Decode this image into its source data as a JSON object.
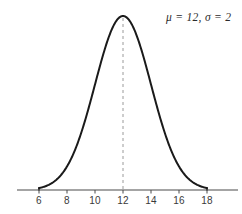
{
  "figure": {
    "width": 242,
    "height": 214,
    "background_color": "#ffffff"
  },
  "annotation": {
    "text": "μ = 12,  σ = 2",
    "mu_symbol": "μ",
    "sigma_symbol": "σ",
    "mu_value": "12",
    "sigma_value": "2",
    "color": "#2b2b2b"
  },
  "axis": {
    "line_color": "#4a4a4a",
    "tick_color": "#4a4a4a",
    "label_color": "#3a3a3a",
    "y_pixel": 190,
    "x_start_pixel": 17,
    "x_end_pixel": 238
  },
  "curve": {
    "color": "#1a1a1a",
    "stroke_width": 2,
    "mean": 12,
    "sigma": 2,
    "domain_min": 6,
    "domain_max": 18
  },
  "mean_line": {
    "color": "#9a9a9a",
    "dash": "3 3",
    "x_value": 12
  },
  "chart_data": {
    "type": "line",
    "title": "",
    "subtitle": "",
    "xlabel": "",
    "ylabel": "",
    "annotations": [
      "μ = 12, σ = 2"
    ],
    "legend_position": "top-right",
    "grid": false,
    "xlim": [
      5.2,
      19.5
    ],
    "ylim": [
      0,
      0.2
    ],
    "xticks": [
      6,
      8,
      10,
      12,
      14,
      16,
      18
    ],
    "xtick_labels": [
      "6",
      "8",
      "10",
      "12",
      "14",
      "16",
      "18"
    ],
    "yticks": [],
    "ytick_labels": [],
    "distribution": "normal",
    "parameters": {
      "mu": 12,
      "sigma": 2
    },
    "series": [
      {
        "name": "Normal PDF (μ=12, σ=2)",
        "color": "#1a1a1a",
        "x": [
          6,
          6.5,
          7,
          7.5,
          8,
          8.5,
          9,
          9.5,
          10,
          10.5,
          11,
          11.5,
          12,
          12.5,
          13,
          13.5,
          14,
          14.5,
          15,
          15.5,
          16,
          16.5,
          17,
          17.5,
          18
        ],
        "y": [
          0.0022,
          0.0043,
          0.0088,
          0.0158,
          0.027,
          0.0432,
          0.0648,
          0.0913,
          0.121,
          0.1506,
          0.176,
          0.1933,
          0.1995,
          0.1933,
          0.176,
          0.1506,
          0.121,
          0.0913,
          0.0648,
          0.0432,
          0.027,
          0.0158,
          0.0088,
          0.0043,
          0.0022
        ]
      }
    ],
    "reference_lines": [
      {
        "name": "mean",
        "orientation": "vertical",
        "value": 12,
        "style": "dashed",
        "color": "#9a9a9a"
      }
    ]
  },
  "tick_labels": [
    {
      "value": 6,
      "label": "6"
    },
    {
      "value": 8,
      "label": "8"
    },
    {
      "value": 10,
      "label": "10"
    },
    {
      "value": 12,
      "label": "12"
    },
    {
      "value": 14,
      "label": "14"
    },
    {
      "value": 16,
      "label": "16"
    },
    {
      "value": 18,
      "label": "18"
    }
  ]
}
